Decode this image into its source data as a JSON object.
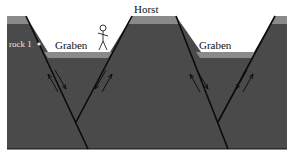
{
  "diagram": {
    "labels": {
      "horst": "Horst",
      "graben_left": "Graben",
      "graben_right": "Graben",
      "rock": "rock 1"
    },
    "colors": {
      "rock_body": "#4a4a4a",
      "surface_layer": "#8a8a8a",
      "fault_line": "#0a0a0a",
      "background": "#ffffff"
    },
    "figure": "stick-figure-person"
  }
}
